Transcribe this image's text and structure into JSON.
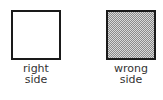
{
  "diagram": {
    "items": [
      {
        "id": "right-side",
        "lines": [
          "right",
          "side"
        ],
        "fill": "#ffffff",
        "pattern": "none"
      },
      {
        "id": "wrong-side",
        "lines": [
          "wrong",
          "side"
        ],
        "fill": "#b0b0b0",
        "pattern": "dotted-gray"
      }
    ],
    "colors": {
      "border": "#1a1a1a",
      "text": "#333333"
    }
  }
}
